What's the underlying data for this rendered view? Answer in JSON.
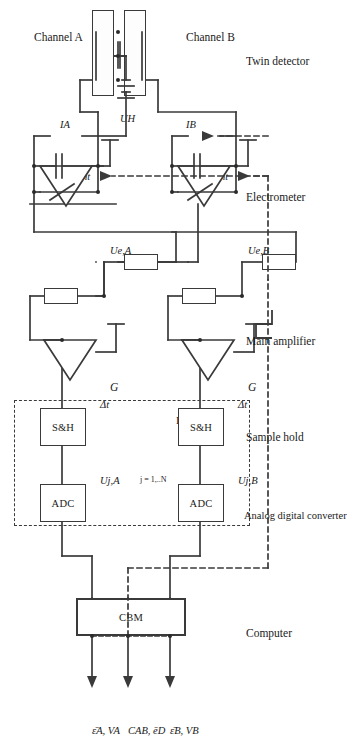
{
  "figure": {
    "type": "block-circuit-diagram",
    "orientation": "rotated-90-ccw",
    "outputs": [
      {
        "id": "out-a",
        "label": "ε̄A, VA"
      },
      {
        "id": "out-mid",
        "label": "CAB, ēD"
      },
      {
        "id": "out-b",
        "label": "ε̄B, VB"
      }
    ],
    "stage_labels": [
      {
        "id": "computer",
        "label": "Computer"
      },
      {
        "id": "analog-digital-converter",
        "label": "Analog digital converter"
      },
      {
        "id": "sample-hold",
        "label": "Sample hold"
      },
      {
        "id": "main-amplifier",
        "label": "Main amplifier"
      },
      {
        "id": "electrometer",
        "label": "Electrometer"
      },
      {
        "id": "twin-detector",
        "label": "Twin detector"
      }
    ],
    "blocks": {
      "cbm": "CBM",
      "interface": "Interface",
      "adc_a": "ADC",
      "adc_b": "ADC",
      "sh_a": "S&H",
      "sh_b": "S&H",
      "gain_a": "G",
      "gain_b": "G"
    },
    "signals": {
      "u_ja": "Uj,A",
      "u_jb": "Uj,B",
      "index_range": "j = 1,..N",
      "dt_a": "Δt",
      "dt_b": "Δt",
      "u_ea": "Ue,A",
      "u_eb": "Ue,B",
      "c_int_a": "Cint",
      "c_int_b": "Cint",
      "u_h": "UH",
      "i_a": "IA",
      "i_b": "IB",
      "channel_a": "Channel A",
      "channel_b": "Channel B",
      "trigger": "pulse-waveform-symbol"
    },
    "colors": {
      "stroke": "#3a3a3a",
      "text": "#1a1a1a",
      "background": "#ffffff"
    }
  }
}
